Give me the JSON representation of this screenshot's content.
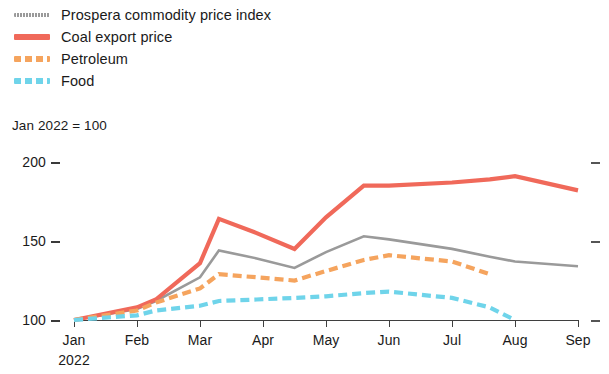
{
  "legend": {
    "items": [
      {
        "label": "Prospera commodity price index",
        "color": "#9a9a9a",
        "style": "solid-thin",
        "name": "prospera-index"
      },
      {
        "label": "Coal export price",
        "color": "#f0695a",
        "style": "solid",
        "name": "coal-export-price"
      },
      {
        "label": "Petroleum",
        "color": "#f5a45e",
        "style": "dashed",
        "name": "petroleum"
      },
      {
        "label": "Food",
        "color": "#6fd4ea",
        "style": "dashed",
        "name": "food"
      }
    ]
  },
  "subtitle": "Jan 2022 = 100",
  "axis": {
    "y_ticks": [
      "200",
      "150",
      "100"
    ],
    "x_ticks": [
      "Jan",
      "Feb",
      "Mar",
      "Apr",
      "May",
      "Jun",
      "Jul",
      "Aug",
      "Sep"
    ],
    "x_year": "2022"
  },
  "chart_data": {
    "type": "line",
    "title": "",
    "subtitle": "Jan 2022 = 100",
    "xlabel": "",
    "ylabel": "",
    "ylim": [
      100,
      200
    ],
    "ytick_values": [
      100,
      150,
      200
    ],
    "grid": false,
    "legend_position": "top-left",
    "x": [
      "Jan",
      "Feb",
      "mid-Feb",
      "Mar",
      "mid-Mar",
      "Apr",
      "mid-Apr",
      "May",
      "mid-May",
      "Jun",
      "Jul",
      "mid-Jul",
      "Aug",
      "Sep"
    ],
    "series": [
      {
        "name": "Prospera commodity price index",
        "color": "#9a9a9a",
        "style": "solid-thin",
        "values": [
          100,
          107,
          112,
          127,
          144,
          139,
          133,
          143,
          153,
          151,
          145,
          140,
          137,
          134
        ]
      },
      {
        "name": "Coal export price",
        "color": "#f0695a",
        "style": "solid",
        "values": [
          100,
          108,
          113,
          136,
          164,
          155,
          145,
          165,
          185,
          185,
          187,
          189,
          191,
          182
        ]
      },
      {
        "name": "Petroleum",
        "color": "#f5a45e",
        "style": "dashed",
        "values": [
          100,
          106,
          111,
          120,
          129,
          127,
          125,
          131,
          138,
          141,
          137,
          129,
          null,
          null
        ]
      },
      {
        "name": "Food",
        "color": "#6fd4ea",
        "style": "dashed",
        "values": [
          100,
          103,
          106,
          109,
          112,
          113,
          114,
          115,
          117,
          118,
          114,
          108,
          100,
          null
        ]
      }
    ]
  }
}
